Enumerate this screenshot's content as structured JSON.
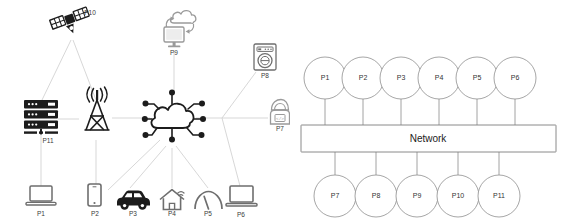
{
  "figure": {
    "panels": [
      {
        "id": "iot-topology",
        "name": "iot-device-topology"
      },
      {
        "id": "bus-topology",
        "name": "network-bus-topology"
      }
    ]
  },
  "left": {
    "center": {
      "icon": "iot-cloud-network-icon",
      "label": ""
    },
    "nodes": [
      {
        "id": "P1",
        "label": "P1",
        "icon": "laptop-icon"
      },
      {
        "id": "P2",
        "label": "P2",
        "icon": "smartphone-icon"
      },
      {
        "id": "P3",
        "label": "P3",
        "icon": "car-icon"
      },
      {
        "id": "P4",
        "label": "P4",
        "icon": "smart-home-wifi-icon"
      },
      {
        "id": "P5",
        "label": "P5",
        "icon": "gauge-icon"
      },
      {
        "id": "P6",
        "label": "P6",
        "icon": "laptop-icon"
      },
      {
        "id": "P7",
        "label": "P7",
        "icon": "hooded-person-icon"
      },
      {
        "id": "P8",
        "label": "P8",
        "icon": "washing-machine-icon"
      },
      {
        "id": "P9",
        "label": "P9",
        "icon": "monitor-cloud-sync-icon"
      },
      {
        "id": "P10",
        "label": "P10",
        "icon": "satellite-icon"
      },
      {
        "id": "P11",
        "label": "P11",
        "icon": "server-rack-icon"
      }
    ],
    "relay": {
      "icon": "cell-tower-icon",
      "label": ""
    }
  },
  "right": {
    "bus": {
      "label": "Network"
    },
    "top_nodes": [
      {
        "label": "P1"
      },
      {
        "label": "P2"
      },
      {
        "label": "P3"
      },
      {
        "label": "P4"
      },
      {
        "label": "P5"
      },
      {
        "label": "P6"
      }
    ],
    "bottom_nodes": [
      {
        "label": "P7"
      },
      {
        "label": "P8"
      },
      {
        "label": "P9"
      },
      {
        "label": "P10"
      },
      {
        "label": "P11"
      }
    ]
  },
  "colors": {
    "ink": "#1c1c1c",
    "link": "#d2d2d2",
    "wire": "#8a8a8a",
    "circle_stroke": "#8f8f8f",
    "background": "#ffffff"
  }
}
